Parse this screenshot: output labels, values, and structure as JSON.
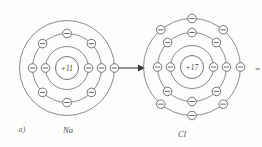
{
  "figure": {
    "panel_label": "a)",
    "background_color": "#fdfdfc",
    "line_color": "#6f6f6f",
    "text_color": "#4a4a4a",
    "width": 262,
    "height": 147,
    "edge_glyph": "="
  },
  "atoms": [
    {
      "id": "sodium",
      "symbol": "Na",
      "nucleus_label": "+11",
      "center_x": 67,
      "center_y": 68,
      "nucleus_radius": 11.5,
      "shells": [
        {
          "index": 1,
          "radius": 21.5,
          "electron_count": 2,
          "angles": [
            0,
            180
          ]
        },
        {
          "index": 2,
          "radius": 34.5,
          "electron_count": 8,
          "angles": [
            0,
            45,
            90,
            135,
            180,
            225,
            270,
            315
          ]
        },
        {
          "index": 3,
          "radius": 47.5,
          "electron_count": 1,
          "angles": [
            0
          ]
        }
      ]
    },
    {
      "id": "chlorine",
      "symbol": "Cl",
      "nucleus_label": "+17",
      "center_x": 192,
      "center_y": 67,
      "nucleus_radius": 11.5,
      "shells": [
        {
          "index": 1,
          "radius": 21.5,
          "electron_count": 2,
          "angles": [
            0,
            180
          ]
        },
        {
          "index": 2,
          "radius": 34.5,
          "electron_count": 8,
          "angles": [
            0,
            45,
            90,
            135,
            180,
            225,
            270,
            315
          ]
        },
        {
          "index": 3,
          "radius": 48.5,
          "electron_count": 7,
          "angles": [
            0,
            50,
            90,
            130,
            230,
            270,
            310
          ]
        }
      ]
    }
  ],
  "arrow": {
    "label": "electron-transfer-arrow",
    "x1": 117,
    "y1": 68,
    "x2": 142,
    "y2": 68
  }
}
